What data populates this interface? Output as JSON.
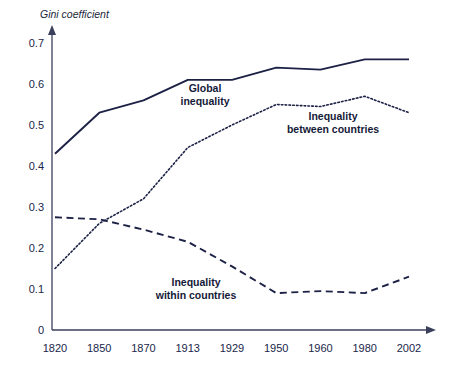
{
  "chart_data": {
    "type": "line",
    "title": "",
    "ylabel": "Gini coefficient",
    "xlabel": "",
    "categories": [
      "1820",
      "1850",
      "1870",
      "1913",
      "1929",
      "1950",
      "1960",
      "1980",
      "2002"
    ],
    "ylim": [
      0,
      0.7
    ],
    "yticks": [
      "0",
      "0.1",
      "0.2",
      "0.3",
      "0.4",
      "0.5",
      "0.6",
      "0.7"
    ],
    "ytick_values": [
      0,
      0.1,
      0.2,
      0.3,
      0.4,
      0.5,
      0.6,
      0.7
    ],
    "grid": false,
    "legend_position": "inline-annotations",
    "series": [
      {
        "name": "Global inequality",
        "style": "solid",
        "color": "#1c2145",
        "values": [
          0.43,
          0.53,
          0.56,
          0.61,
          0.61,
          0.64,
          0.635,
          0.66,
          0.66
        ]
      },
      {
        "name": "Inequality between countries",
        "style": "dotted",
        "color": "#1c2145",
        "values": [
          0.15,
          0.26,
          0.32,
          0.445,
          0.5,
          0.55,
          0.545,
          0.57,
          0.53
        ]
      },
      {
        "name": "Inequality within countries",
        "style": "dashed",
        "color": "#1c2145",
        "values": [
          0.275,
          0.27,
          0.245,
          0.215,
          0.155,
          0.09,
          0.095,
          0.09,
          0.13
        ]
      }
    ],
    "annotations": [
      {
        "id": "global",
        "text_line1": "Global",
        "text_line2": "inequality",
        "x": 205,
        "y": 92
      },
      {
        "id": "between",
        "text_line1": "Inequality",
        "text_line2": "between countries",
        "x": 333,
        "y": 120
      },
      {
        "id": "within",
        "text_line1": "Inequality",
        "text_line2": "within countries",
        "x": 196,
        "y": 286
      }
    ]
  },
  "axis": {
    "y_label": "Gini coefficient",
    "y_ticks": [
      "0.7",
      "0.6",
      "0.5",
      "0.4",
      "0.3",
      "0.2",
      "0.1",
      "0"
    ],
    "x_ticks": [
      "1820",
      "1850",
      "1870",
      "1913",
      "1929",
      "1950",
      "1960",
      "1980",
      "2002"
    ]
  },
  "colors": {
    "ink": "#1c2145",
    "axis": "#3a3f5c",
    "background": "#ffffff"
  }
}
